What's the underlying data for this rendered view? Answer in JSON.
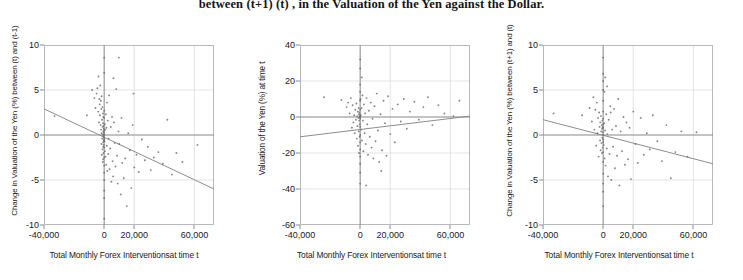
{
  "caption": {
    "text": "between (t+1) (t) , in the Valuation of the Yen against the Dollar."
  },
  "xaxis_label": "Total Monthly Forex Interventionsat time t",
  "panels": [
    {
      "name": "panel-left",
      "ylabel": "Change in Valuation of the Yen (%) between (t) and (t-1)",
      "xlabel": "Total Monthly Forex Interventionsat time t"
    },
    {
      "name": "panel-middle",
      "ylabel": "Valuation of the Yen (%) at time t",
      "xlabel": "Total Monthly Forex Interventionsat time t"
    },
    {
      "name": "panel-right",
      "ylabel": "Change in Valuation of the Yen (%) between (t+1) and (t)",
      "xlabel": "Total Monthly Forex Interventionsat time t"
    }
  ],
  "colors": {
    "point": "#6b6b6b",
    "trendline": "#8d8d8d",
    "gridline": "#d8d8d8",
    "frame": "#a8a8a8",
    "axis": "#8a8a8a",
    "text": "#1a1a1a"
  },
  "chart_data": [
    {
      "type": "scatter",
      "title": "Change in Valuation of the Yen (%) between (t) and (t-1) vs Total Monthly Forex Interventions at time t",
      "xlabel": "Total Monthly Forex Interventionsat time t",
      "ylabel": "Change in Valuation of the Yen (%) between (t) and (t-1)",
      "xlim": [
        -40000,
        73000
      ],
      "ylim": [
        -10,
        10
      ],
      "xticks": [
        -40000,
        0,
        20000,
        60000
      ],
      "xticklabels": [
        "-40,000",
        "0",
        "20,000",
        "60,000"
      ],
      "yticks": [
        -10,
        -5,
        0,
        5,
        10
      ],
      "yticklabels": [
        "-10",
        "-5",
        "0",
        "5",
        "10"
      ],
      "grid": true,
      "legend": "none",
      "trendline": {
        "x0": -40000,
        "y0": 2.9,
        "x1": 73000,
        "y1": -6.0,
        "slope_per_10000": -0.79
      },
      "points": [
        [
          -11500,
          2.2
        ],
        [
          -33000,
          2.1
        ],
        [
          -8000,
          5.0
        ],
        [
          -6500,
          4.1
        ],
        [
          -5800,
          3.0
        ],
        [
          -5000,
          4.6
        ],
        [
          -4500,
          5.2
        ],
        [
          -4000,
          2.6
        ],
        [
          -3800,
          6.5
        ],
        [
          -3500,
          1.4
        ],
        [
          -3200,
          4.0
        ],
        [
          -3000,
          3.4
        ],
        [
          -2800,
          2.2
        ],
        [
          -2600,
          5.5
        ],
        [
          -2400,
          1.1
        ],
        [
          -2200,
          3.8
        ],
        [
          -2000,
          0.6
        ],
        [
          -1900,
          2.9
        ],
        [
          -1800,
          -1.0
        ],
        [
          -1700,
          4.3
        ],
        [
          -1600,
          0.2
        ],
        [
          -1500,
          -2.2
        ],
        [
          -1400,
          1.7
        ],
        [
          -1300,
          -0.4
        ],
        [
          -1200,
          3.1
        ],
        [
          -1100,
          -1.6
        ],
        [
          -1000,
          0.9
        ],
        [
          -900,
          -3.0
        ],
        [
          -850,
          2.4
        ],
        [
          -800,
          0.0
        ],
        [
          -750,
          -2.7
        ],
        [
          -700,
          1.3
        ],
        [
          -650,
          -0.8
        ],
        [
          -600,
          2.0
        ],
        [
          -550,
          -1.3
        ],
        [
          -500,
          0.4
        ],
        [
          -450,
          -2.0
        ],
        [
          -400,
          1.0
        ],
        [
          -350,
          -0.2
        ],
        [
          -300,
          0.7
        ],
        [
          -250,
          -1.1
        ],
        [
          -200,
          0.3
        ],
        [
          -150,
          -0.6
        ],
        [
          -100,
          0.1
        ],
        [
          -50,
          -0.3
        ],
        [
          0,
          0.0
        ],
        [
          0,
          -0.5
        ],
        [
          0,
          0.5
        ],
        [
          0,
          -1.4
        ],
        [
          0,
          1.9
        ],
        [
          0,
          -2.5
        ],
        [
          0,
          2.7
        ],
        [
          0,
          -3.4
        ],
        [
          0,
          -4.2
        ],
        [
          0,
          -5.0
        ],
        [
          0,
          -6.2
        ],
        [
          0,
          -7.0
        ],
        [
          0,
          -9.3
        ],
        [
          0,
          8.6
        ],
        [
          0,
          6.9
        ],
        [
          200,
          -0.7
        ],
        [
          400,
          1.2
        ],
        [
          500,
          -1.8
        ],
        [
          700,
          0.6
        ],
        [
          900,
          -2.4
        ],
        [
          1100,
          2.3
        ],
        [
          1300,
          -3.3
        ],
        [
          1500,
          0.8
        ],
        [
          1700,
          -1.2
        ],
        [
          1900,
          3.6
        ],
        [
          2100,
          -4.0
        ],
        [
          2400,
          1.6
        ],
        [
          2700,
          -2.1
        ],
        [
          3000,
          -0.4
        ],
        [
          3300,
          4.4
        ],
        [
          3600,
          -3.8
        ],
        [
          4000,
          -1.5
        ],
        [
          4400,
          0.9
        ],
        [
          4800,
          -5.2
        ],
        [
          5200,
          2.0
        ],
        [
          5600,
          -2.9
        ],
        [
          6000,
          -4.6
        ],
        [
          6500,
          1.4
        ],
        [
          7000,
          -0.9
        ],
        [
          7500,
          -3.5
        ],
        [
          8000,
          5.1
        ],
        [
          8500,
          -2.3
        ],
        [
          9000,
          -5.4
        ],
        [
          9500,
          0.4
        ],
        [
          10000,
          -1.0
        ],
        [
          11000,
          -6.6
        ],
        [
          11500,
          1.9
        ],
        [
          12000,
          -3.1
        ],
        [
          13000,
          -4.8
        ],
        [
          14000,
          -2.6
        ],
        [
          15000,
          -7.9
        ],
        [
          16000,
          0.2
        ],
        [
          17000,
          -1.7
        ],
        [
          18000,
          -5.9
        ],
        [
          19000,
          1.1
        ],
        [
          20000,
          -3.6
        ],
        [
          21500,
          -2.2
        ],
        [
          23000,
          -4.1
        ],
        [
          25000,
          -0.5
        ],
        [
          27000,
          -2.8
        ],
        [
          29000,
          -1.3
        ],
        [
          31000,
          -3.9
        ],
        [
          33000,
          -2.5
        ],
        [
          36000,
          -1.9
        ],
        [
          39000,
          -3.2
        ],
        [
          42000,
          1.7
        ],
        [
          45000,
          -4.4
        ],
        [
          48000,
          -2.0
        ],
        [
          52000,
          -3.0
        ],
        [
          62000,
          -1.1
        ],
        [
          19500,
          4.6
        ],
        [
          9800,
          8.6
        ],
        [
          6200,
          6.3
        ]
      ]
    },
    {
      "type": "scatter",
      "title": "Valuation of the Yen (%) at time t vs Total Monthly Forex Interventions at time t",
      "xlabel": "Total Monthly Forex Interventionsat time t",
      "ylabel": "Valuation of the Yen (%) at time t",
      "xlim": [
        -40000,
        73000
      ],
      "ylim": [
        -60,
        40
      ],
      "xticks": [
        -40000,
        0,
        20000,
        60000
      ],
      "xticklabels": [
        "-40,000",
        "0",
        "20,000",
        "60,000"
      ],
      "yticks": [
        -60,
        -40,
        -20,
        0,
        20,
        40
      ],
      "yticklabels": [
        "-60",
        "-40",
        "-20",
        "0",
        "20",
        "40"
      ],
      "grid": true,
      "legend": "none",
      "trendline": {
        "x0": -40000,
        "y0": -11.0,
        "x1": 73000,
        "y1": 0.5,
        "slope_per_10000": 1.02
      },
      "points": [
        [
          -24000,
          11.0
        ],
        [
          -12500,
          9.5
        ],
        [
          -9000,
          5.5
        ],
        [
          -8000,
          8.0
        ],
        [
          -7000,
          2.0
        ],
        [
          -6200,
          10.5
        ],
        [
          -5500,
          -6.0
        ],
        [
          -5000,
          6.5
        ],
        [
          -4500,
          -3.0
        ],
        [
          -4000,
          1.0
        ],
        [
          -3600,
          -9.0
        ],
        [
          -3200,
          4.0
        ],
        [
          -2800,
          -1.5
        ],
        [
          -2500,
          7.5
        ],
        [
          -2200,
          -12.0
        ],
        [
          -2000,
          0.5
        ],
        [
          -1800,
          -5.0
        ],
        [
          -1600,
          3.0
        ],
        [
          -1400,
          -16.0
        ],
        [
          -1200,
          -0.5
        ],
        [
          -1000,
          5.0
        ],
        [
          -900,
          -8.0
        ],
        [
          -800,
          1.5
        ],
        [
          -700,
          -20.0
        ],
        [
          -600,
          -2.0
        ],
        [
          -500,
          2.5
        ],
        [
          -400,
          -11.0
        ],
        [
          -300,
          0.0
        ],
        [
          -200,
          -4.0
        ],
        [
          -100,
          1.0
        ],
        [
          0,
          0.0
        ],
        [
          0,
          32.0
        ],
        [
          0,
          27.0
        ],
        [
          0,
          18.0
        ],
        [
          0,
          14.0
        ],
        [
          0,
          9.0
        ],
        [
          0,
          4.0
        ],
        [
          0,
          -1.0
        ],
        [
          0,
          -5.5
        ],
        [
          0,
          -10.0
        ],
        [
          0,
          -14.0
        ],
        [
          0,
          -18.0
        ],
        [
          0,
          -22.0
        ],
        [
          0,
          -26.0
        ],
        [
          0,
          -31.0
        ],
        [
          0,
          -37.0
        ],
        [
          200,
          10.0
        ],
        [
          400,
          1.0
        ],
        [
          600,
          -7.0
        ],
        [
          900,
          5.0
        ],
        [
          1200,
          -13.0
        ],
        [
          1500,
          12.0
        ],
        [
          1800,
          -2.0
        ],
        [
          2100,
          -19.0
        ],
        [
          2500,
          7.0
        ],
        [
          2900,
          -9.0
        ],
        [
          3300,
          2.0
        ],
        [
          3700,
          -15.0
        ],
        [
          4200,
          10.5
        ],
        [
          4700,
          -4.0
        ],
        [
          5200,
          -21.0
        ],
        [
          5800,
          3.5
        ],
        [
          6400,
          -11.0
        ],
        [
          7000,
          8.0
        ],
        [
          7600,
          -17.0
        ],
        [
          8200,
          -1.0
        ],
        [
          8800,
          -23.0
        ],
        [
          9500,
          6.0
        ],
        [
          10200,
          -13.5
        ],
        [
          11000,
          13.0
        ],
        [
          11800,
          -7.5
        ],
        [
          12600,
          -25.0
        ],
        [
          13500,
          1.5
        ],
        [
          14500,
          -18.5
        ],
        [
          15500,
          9.0
        ],
        [
          16500,
          -3.5
        ],
        [
          17500,
          -21.5
        ],
        [
          18500,
          11.5
        ],
        [
          20000,
          -9.5
        ],
        [
          21500,
          4.5
        ],
        [
          23000,
          -14.0
        ],
        [
          25000,
          7.0
        ],
        [
          27000,
          -2.5
        ],
        [
          29000,
          10.0
        ],
        [
          31000,
          -6.5
        ],
        [
          33000,
          3.0
        ],
        [
          36000,
          8.5
        ],
        [
          39000,
          -1.5
        ],
        [
          42000,
          5.5
        ],
        [
          45000,
          11.0
        ],
        [
          48000,
          -4.5
        ],
        [
          52000,
          6.5
        ],
        [
          56000,
          2.0
        ],
        [
          62000,
          0.5
        ],
        [
          66000,
          9.0
        ],
        [
          14000,
          -30.0
        ],
        [
          4000,
          -38.0
        ],
        [
          1000,
          22.0
        ]
      ]
    },
    {
      "type": "scatter",
      "title": "Change in Valuation of the Yen (%) between (t+1) and (t) vs Total Monthly Forex Interventions at time t",
      "xlabel": "Total Monthly Forex Interventionsat time t",
      "ylabel": "Change in Valuation of the Yen (%) between (t+1) and (t)",
      "xlim": [
        -40000,
        73000
      ],
      "ylim": [
        -10,
        10
      ],
      "xticks": [
        -40000,
        0,
        20000,
        60000
      ],
      "xticklabels": [
        "-40,000",
        "0",
        "20,000",
        "60,000"
      ],
      "yticks": [
        -10,
        -5,
        0,
        5,
        10
      ],
      "yticklabels": [
        "-10",
        "-5",
        "0",
        "5",
        "10"
      ],
      "grid": true,
      "legend": "none",
      "trendline": {
        "x0": -40000,
        "y0": 1.7,
        "x1": 73000,
        "y1": -3.2,
        "slope_per_10000": -0.43
      },
      "points": [
        [
          -33000,
          2.4
        ],
        [
          -14000,
          2.2
        ],
        [
          -9000,
          3.0
        ],
        [
          -7500,
          1.5
        ],
        [
          -6500,
          4.2
        ],
        [
          -5800,
          0.6
        ],
        [
          -5200,
          2.8
        ],
        [
          -4600,
          -1.2
        ],
        [
          -4200,
          3.6
        ],
        [
          -3800,
          0.2
        ],
        [
          -3400,
          1.9
        ],
        [
          -3000,
          -2.4
        ],
        [
          -2700,
          2.5
        ],
        [
          -2400,
          0.9
        ],
        [
          -2100,
          -0.6
        ],
        [
          -1900,
          1.4
        ],
        [
          -1700,
          -1.7
        ],
        [
          -1500,
          2.1
        ],
        [
          -1300,
          0.4
        ],
        [
          -1100,
          -0.9
        ],
        [
          -950,
          1.1
        ],
        [
          -800,
          -2.0
        ],
        [
          -700,
          0.7
        ],
        [
          -600,
          1.6
        ],
        [
          -500,
          -0.3
        ],
        [
          -400,
          0.9
        ],
        [
          -300,
          -1.4
        ],
        [
          -200,
          0.3
        ],
        [
          -100,
          1.2
        ],
        [
          -50,
          -0.5
        ],
        [
          0,
          0.0
        ],
        [
          0,
          0.8
        ],
        [
          0,
          -0.8
        ],
        [
          0,
          1.8
        ],
        [
          0,
          -1.9
        ],
        [
          0,
          2.6
        ],
        [
          0,
          -3.0
        ],
        [
          0,
          3.8
        ],
        [
          0,
          -4.3
        ],
        [
          0,
          5.0
        ],
        [
          0,
          -5.4
        ],
        [
          0,
          6.0
        ],
        [
          0,
          -6.3
        ],
        [
          0,
          6.8
        ],
        [
          0,
          -7.9
        ],
        [
          0,
          8.6
        ],
        [
          300,
          -1.1
        ],
        [
          600,
          1.3
        ],
        [
          900,
          -2.6
        ],
        [
          1200,
          0.5
        ],
        [
          1600,
          -3.4
        ],
        [
          2000,
          2.3
        ],
        [
          2400,
          -1.5
        ],
        [
          2800,
          0.1
        ],
        [
          3200,
          -4.6
        ],
        [
          3700,
          1.7
        ],
        [
          4200,
          -2.1
        ],
        [
          4800,
          3.2
        ],
        [
          5400,
          -5.0
        ],
        [
          6000,
          0.6
        ],
        [
          6600,
          -1.3
        ],
        [
          7200,
          2.9
        ],
        [
          7800,
          -3.7
        ],
        [
          8500,
          1.0
        ],
        [
          9200,
          -2.3
        ],
        [
          10000,
          4.0
        ],
        [
          10800,
          -5.6
        ],
        [
          11600,
          0.4
        ],
        [
          12500,
          -1.8
        ],
        [
          13500,
          2.0
        ],
        [
          14500,
          -3.3
        ],
        [
          15500,
          1.4
        ],
        [
          16500,
          -2.7
        ],
        [
          17500,
          0.8
        ],
        [
          18500,
          -4.9
        ],
        [
          20000,
          2.6
        ],
        [
          21500,
          -1.0
        ],
        [
          23000,
          -3.1
        ],
        [
          25000,
          1.9
        ],
        [
          27000,
          -2.2
        ],
        [
          29000,
          0.2
        ],
        [
          31000,
          -1.6
        ],
        [
          33000,
          2.2
        ],
        [
          36000,
          -0.7
        ],
        [
          39000,
          -2.9
        ],
        [
          42000,
          1.1
        ],
        [
          45000,
          -4.8
        ],
        [
          48000,
          -1.9
        ],
        [
          52000,
          0.4
        ],
        [
          56000,
          -2.4
        ],
        [
          62000,
          0.3
        ],
        [
          5000,
          2.5
        ],
        [
          2600,
          5.4
        ],
        [
          1400,
          6.4
        ],
        [
          800,
          4.8
        ]
      ]
    }
  ]
}
